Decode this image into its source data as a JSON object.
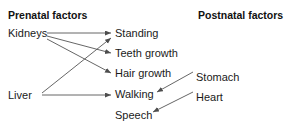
{
  "diagram": {
    "title_left": "Prenatal factors",
    "title_right": "Postnatal factors",
    "background_color": "#ffffff",
    "text_color": "#1a1a1a",
    "edge_color": "#555555",
    "columns": {
      "prenatal": {
        "heading": "Prenatal factors",
        "nodes": [
          {
            "label": "Kidneys",
            "x": 8,
            "y": 28
          },
          {
            "label": "Liver",
            "x": 8,
            "y": 90
          }
        ]
      },
      "outcomes": {
        "nodes": [
          {
            "label": "Standing",
            "x": 115,
            "y": 28
          },
          {
            "label": "Teeth growth",
            "x": 115,
            "y": 48
          },
          {
            "label": "Hair growth",
            "x": 115,
            "y": 68
          },
          {
            "label": "Walking",
            "x": 115,
            "y": 89
          },
          {
            "label": "Speech",
            "x": 115,
            "y": 110
          }
        ]
      },
      "postnatal": {
        "heading": "Postnatal factors",
        "nodes": [
          {
            "label": "Stomach",
            "x": 196,
            "y": 72
          },
          {
            "label": "Heart",
            "x": 196,
            "y": 92
          }
        ]
      }
    },
    "edges": [
      {
        "from": "Kidneys",
        "to": "Standing",
        "x1": 47,
        "y1": 33,
        "x2": 111,
        "y2": 33
      },
      {
        "from": "Kidneys",
        "to": "Teeth growth",
        "x1": 47,
        "y1": 36,
        "x2": 111,
        "y2": 53
      },
      {
        "from": "Kidneys",
        "to": "Hair growth",
        "x1": 47,
        "y1": 39,
        "x2": 111,
        "y2": 73
      },
      {
        "from": "Liver",
        "to": "Standing",
        "x1": 42,
        "y1": 93,
        "x2": 111,
        "y2": 38
      },
      {
        "from": "Liver",
        "to": "Walking",
        "x1": 42,
        "y1": 95,
        "x2": 111,
        "y2": 95
      },
      {
        "from": "Stomach",
        "to": "Walking",
        "x1": 193,
        "y1": 72,
        "x2": 157,
        "y2": 92
      },
      {
        "from": "Heart",
        "to": "Speech",
        "x1": 193,
        "y1": 92,
        "x2": 153,
        "y2": 112
      }
    ]
  }
}
